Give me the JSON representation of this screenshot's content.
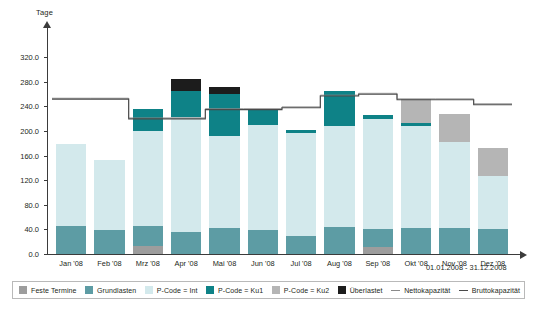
{
  "axis": {
    "y_title": "Tage",
    "y_ticks": [
      "0.0",
      "40.0",
      "80.0",
      "120.0",
      "160.0",
      "200.0",
      "240.0",
      "280.0",
      "320.0"
    ]
  },
  "period_label": "01.01.2008 - 31.12.2008",
  "legend": {
    "items": [
      {
        "label": "Feste Termine",
        "type": "swatch",
        "color": "#9d9d9d",
        "name": "feste-termine"
      },
      {
        "label": "Grundlasten",
        "type": "swatch",
        "color": "#5d9ca4",
        "name": "grundlasten"
      },
      {
        "label": "P-Code = Int",
        "type": "swatch",
        "color": "#d3e9ec",
        "name": "p-code-int"
      },
      {
        "label": "P-Code = Ku1",
        "type": "swatch",
        "color": "#0e8287",
        "name": "p-code-ku1"
      },
      {
        "label": "P-Code = Ku2",
        "type": "swatch",
        "color": "#b5b5b5",
        "name": "p-code-ku2"
      },
      {
        "label": "Überlastet",
        "type": "swatch",
        "color": "#1c1c1c",
        "name": "ueberlastet"
      },
      {
        "label": "Nettokapazität",
        "type": "line",
        "color": "#8a8a8a",
        "name": "nettokapazitaet"
      },
      {
        "label": "Bruttokapazität",
        "type": "line",
        "color": "#4a4a4a",
        "name": "bruttokapazitaet"
      }
    ]
  },
  "chart_data": {
    "type": "bar",
    "title": "",
    "subtitle": "01.01.2008 - 31.12.2008",
    "xlabel": "",
    "ylabel": "Tage",
    "ylim": [
      0,
      340
    ],
    "yticks": [
      0,
      40,
      80,
      120,
      160,
      200,
      240,
      280,
      320
    ],
    "grid": false,
    "stacked": true,
    "legend_position": "bottom",
    "categories": [
      "Jan '08",
      "Feb '08",
      "Mrz '08",
      "Apr '08",
      "Mai '08",
      "Jun '08",
      "Jul '08",
      "Aug '08",
      "Sep '08",
      "Okt '08",
      "Nov '08",
      "Dez '08"
    ],
    "series": [
      {
        "name": "Feste Termine",
        "color": "#9d9d9d",
        "values": [
          0,
          0,
          13,
          0,
          0,
          0,
          0,
          0,
          11,
          0,
          0,
          0
        ]
      },
      {
        "name": "Grundlasten",
        "color": "#5d9ca4",
        "values": [
          46,
          39,
          32,
          36,
          43,
          39,
          30,
          44,
          29,
          43,
          43,
          41
        ]
      },
      {
        "name": "P-Code = Int",
        "color": "#d3e9ec",
        "values": [
          133,
          114,
          155,
          187,
          148,
          170,
          166,
          164,
          180,
          165,
          139,
          86
        ]
      },
      {
        "name": "P-Code = Ku1",
        "color": "#0e8287",
        "values": [
          0,
          0,
          36,
          41,
          69,
          25,
          6,
          57,
          6,
          5,
          0,
          0
        ]
      },
      {
        "name": "P-Code = Ku2",
        "color": "#b5b5b5",
        "values": [
          0,
          0,
          0,
          0,
          0,
          0,
          0,
          0,
          0,
          38,
          45,
          45
        ]
      },
      {
        "name": "Überlastet",
        "color": "#1c1c1c",
        "values": [
          0,
          0,
          0,
          21,
          11,
          0,
          0,
          0,
          0,
          0,
          0,
          0
        ]
      }
    ],
    "lines": [
      {
        "name": "Nettokapazität",
        "color": "#8a8a8a",
        "style": "step",
        "values": [
          253,
          253,
          221,
          221,
          236,
          236,
          239,
          258,
          261,
          252,
          252,
          244
        ]
      },
      {
        "name": "Bruttokapazität",
        "color": "#4a4a4a",
        "style": "step",
        "values": [
          253,
          253,
          221,
          221,
          236,
          236,
          239,
          258,
          261,
          252,
          252,
          244
        ]
      }
    ]
  }
}
